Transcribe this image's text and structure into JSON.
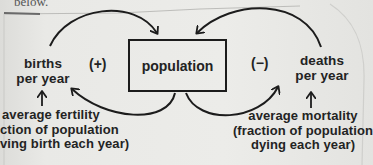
{
  "caption": {
    "text": "below."
  },
  "diagram": {
    "type": "causal-loop",
    "stock": {
      "label": "population"
    },
    "flows": [
      {
        "id": "births",
        "lines": [
          "births",
          "per year"
        ],
        "polarity": "(+)"
      },
      {
        "id": "deaths",
        "lines": [
          "deaths",
          "per year"
        ],
        "polarity": "(−)"
      }
    ],
    "parameters": [
      {
        "id": "fertility",
        "lines": [
          "average fertility",
          "(fraction of population",
          "giving birth each year)"
        ],
        "visible_lines": [
          "average fertility",
          "ction of population",
          "ving birth each year)"
        ]
      },
      {
        "id": "mortality",
        "lines": [
          "average mortality",
          "(fraction of population",
          "dying each year)"
        ]
      }
    ],
    "links": [
      {
        "from": "births",
        "to": "population"
      },
      {
        "from": "population",
        "to": "births"
      },
      {
        "from": "deaths",
        "to": "population"
      },
      {
        "from": "population",
        "to": "deaths"
      },
      {
        "from": "fertility",
        "to": "births"
      },
      {
        "from": "mortality",
        "to": "deaths"
      }
    ],
    "colors": {
      "ink": "#1c1c1c",
      "paper": "#e9e9e6"
    }
  }
}
